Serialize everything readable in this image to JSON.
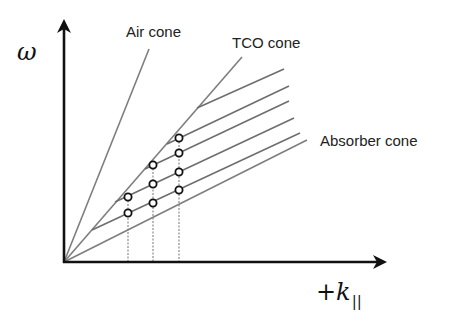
{
  "diagram": {
    "y_axis": {
      "label": "ω"
    },
    "x_axis": {
      "label_prefix": "+",
      "label_main": "k",
      "label_sub": "||"
    },
    "cones": [
      {
        "name": "Air cone",
        "label": "Air cone"
      },
      {
        "name": "TCO cone",
        "label": "TCO cone"
      },
      {
        "name": "Absorber cone",
        "label": "Absorber cone"
      }
    ],
    "mode_lines_count": 5,
    "mode_columns": [
      {
        "x_index": 1,
        "circles": 2
      },
      {
        "x_index": 2,
        "circles": 3
      },
      {
        "x_index": 3,
        "circles": 4
      }
    ],
    "colors": {
      "axis": "#111111",
      "lines": "#7a7a7a",
      "dotted": "#a0a0a0",
      "circle_stroke": "#111111"
    }
  }
}
